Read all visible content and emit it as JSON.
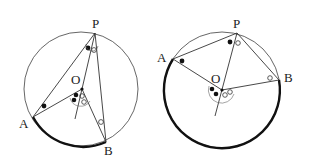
{
  "figures": [
    {
      "id": "left",
      "labels": {
        "P": "P",
        "O": "O",
        "A": "A",
        "B": "B"
      }
    },
    {
      "id": "right",
      "labels": {
        "P": "P",
        "O": "O",
        "A": "A",
        "B": "B"
      }
    }
  ],
  "colors": {
    "line": "#333333",
    "arc": "#111111",
    "background": "#ffffff"
  }
}
